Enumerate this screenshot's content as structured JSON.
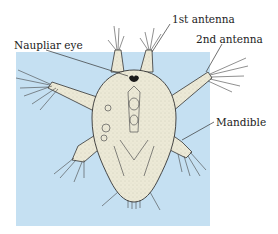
{
  "figure": {
    "background_color": "#c5e0f2",
    "body_color": "#ece9d6",
    "outline_color": "#333333"
  },
  "labels": {
    "first_antenna": "1st antenna",
    "second_antenna": "2nd antenna",
    "naupliar_eye": "Naupliar eye",
    "mandible": "Mandible"
  }
}
